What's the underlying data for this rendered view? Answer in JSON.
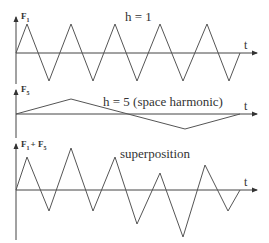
{
  "figure": {
    "plots": [
      {
        "id": "fundamental",
        "y_label": "F",
        "y_sub": "1",
        "y_sub2": "",
        "title": "h = 1",
        "x_label": "t",
        "axis": {
          "x": 16,
          "top": 16,
          "bottom": 84,
          "baseline": 53,
          "arrow_end": 258
        },
        "title_pos": [
          125,
          21
        ],
        "points": "16,53 27,24 49,81 71,24 93,81 115,24 137,81 160,24 183,81 207,24 229,81 240,53"
      },
      {
        "id": "fifth-harmonic",
        "y_label": "F",
        "y_sub": "5",
        "y_sub2": "",
        "title": "h = 5 (space harmonic)",
        "x_label": "t",
        "axis": {
          "x": 16,
          "top": 89,
          "bottom": 138,
          "baseline": 114,
          "arrow_end": 258
        },
        "title_pos": [
          103,
          105
        ],
        "points": "16,114 71,99 185,129 240,114"
      },
      {
        "id": "superposition",
        "y_label": "F",
        "y_sub": "1",
        "y_plus": "+ F",
        "y_sub2": "5",
        "title": "superposition",
        "x_label": "t",
        "axis": {
          "x": 16,
          "top": 143,
          "bottom": 240,
          "baseline": 190,
          "arrow_end": 258
        },
        "title_pos": [
          120,
          156
        ],
        "points": "16,190 27,157 49,211 71,148 93,211 115,157 137,224 160,173 183,237 205,165 228,211 240,190"
      }
    ]
  }
}
